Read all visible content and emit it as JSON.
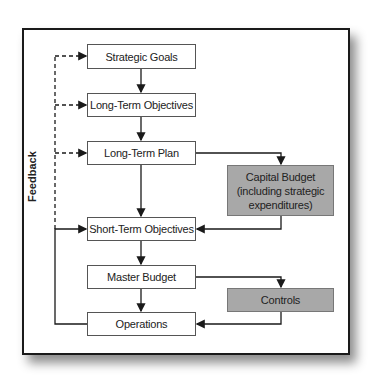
{
  "diagram": {
    "feedback_label": "Feedback",
    "nodes": {
      "strategic_goals": "Strategic Goals",
      "long_term_objectives": "Long-Term Objectives",
      "long_term_plan": "Long-Term Plan",
      "capital_budget": "Capital Budget (including strategic expenditures)",
      "short_term_objectives": "Short-Term Objectives",
      "master_budget": "Master Budget",
      "controls": "Controls",
      "operations": "Operations"
    },
    "edges": [
      {
        "from": "strategic_goals",
        "to": "long_term_objectives",
        "style": "solid"
      },
      {
        "from": "long_term_objectives",
        "to": "long_term_plan",
        "style": "solid"
      },
      {
        "from": "long_term_plan",
        "to": "short_term_objectives",
        "style": "solid"
      },
      {
        "from": "long_term_plan",
        "to": "capital_budget",
        "style": "solid"
      },
      {
        "from": "capital_budget",
        "to": "short_term_objectives",
        "style": "solid"
      },
      {
        "from": "short_term_objectives",
        "to": "master_budget",
        "style": "solid"
      },
      {
        "from": "master_budget",
        "to": "operations",
        "style": "solid"
      },
      {
        "from": "master_budget",
        "to": "controls",
        "style": "solid"
      },
      {
        "from": "controls",
        "to": "operations",
        "style": "solid"
      },
      {
        "from": "operations",
        "to": "short_term_objectives",
        "style": "solid",
        "label": "Feedback"
      },
      {
        "from": "operations",
        "to": "long_term_plan",
        "style": "dashed",
        "label": "Feedback"
      },
      {
        "from": "operations",
        "to": "long_term_objectives",
        "style": "dashed",
        "label": "Feedback"
      },
      {
        "from": "operations",
        "to": "strategic_goals",
        "style": "dashed",
        "label": "Feedback"
      }
    ],
    "colors": {
      "highlight_fill": "#a8a8a8",
      "line": "#1a1a1a"
    }
  }
}
